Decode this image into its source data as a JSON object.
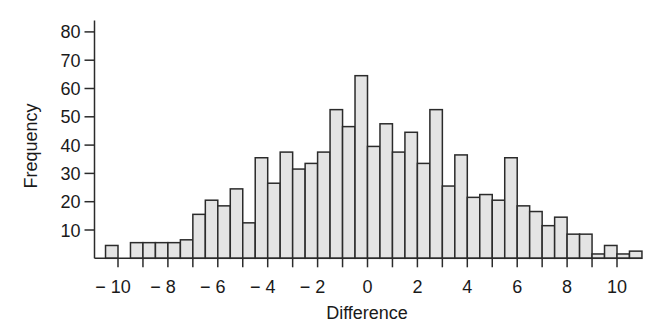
{
  "chart_data": {
    "type": "bar",
    "subtype": "histogram",
    "title": "",
    "xlabel": "Difference",
    "ylabel": "Frequency",
    "bin_width": 0.5,
    "xlim": [
      -10.5,
      11
    ],
    "ylim": [
      0,
      80
    ],
    "grid": false,
    "legend": null,
    "x_ticks": [
      -10,
      -9,
      -8,
      -7,
      -6,
      -5,
      -4,
      -3,
      -2,
      -1,
      0,
      1,
      2,
      3,
      4,
      5,
      6,
      7,
      8,
      9,
      10
    ],
    "x_tick_labels": [
      "−10",
      "",
      "−8",
      "",
      "−6",
      "",
      "−4",
      "",
      "−2",
      "",
      "0",
      "",
      "2",
      "",
      "4",
      "",
      "6",
      "",
      "8",
      "",
      "10"
    ],
    "y_ticks": [
      10,
      20,
      30,
      40,
      50,
      60,
      70,
      80
    ],
    "y_tick_labels": [
      "10",
      "20",
      "30",
      "40",
      "50",
      "60",
      "70",
      "80"
    ],
    "bins": [
      {
        "start": -10.5,
        "end": -10.0,
        "count": 4
      },
      {
        "start": -10.0,
        "end": -9.5,
        "count": 0
      },
      {
        "start": -9.5,
        "end": -9.0,
        "count": 5
      },
      {
        "start": -9.0,
        "end": -8.5,
        "count": 5
      },
      {
        "start": -8.5,
        "end": -8.0,
        "count": 5
      },
      {
        "start": -8.0,
        "end": -7.5,
        "count": 5
      },
      {
        "start": -7.5,
        "end": -7.0,
        "count": 6
      },
      {
        "start": -7.0,
        "end": -6.5,
        "count": 15
      },
      {
        "start": -6.5,
        "end": -6.0,
        "count": 20
      },
      {
        "start": -6.0,
        "end": -5.5,
        "count": 18
      },
      {
        "start": -5.5,
        "end": -5.0,
        "count": 24
      },
      {
        "start": -5.0,
        "end": -4.5,
        "count": 12
      },
      {
        "start": -4.5,
        "end": -4.0,
        "count": 35
      },
      {
        "start": -4.0,
        "end": -3.5,
        "count": 26
      },
      {
        "start": -3.5,
        "end": -3.0,
        "count": 37
      },
      {
        "start": -3.0,
        "end": -2.5,
        "count": 31
      },
      {
        "start": -2.5,
        "end": -2.0,
        "count": 33
      },
      {
        "start": -2.0,
        "end": -1.5,
        "count": 37
      },
      {
        "start": -1.5,
        "end": -1.0,
        "count": 52
      },
      {
        "start": -1.0,
        "end": -0.5,
        "count": 46
      },
      {
        "start": -0.5,
        "end": 0.0,
        "count": 64
      },
      {
        "start": 0.0,
        "end": 0.5,
        "count": 39
      },
      {
        "start": 0.5,
        "end": 1.0,
        "count": 47
      },
      {
        "start": 1.0,
        "end": 1.5,
        "count": 37
      },
      {
        "start": 1.5,
        "end": 2.0,
        "count": 44
      },
      {
        "start": 2.0,
        "end": 2.5,
        "count": 33
      },
      {
        "start": 2.5,
        "end": 3.0,
        "count": 52
      },
      {
        "start": 3.0,
        "end": 3.5,
        "count": 25
      },
      {
        "start": 3.5,
        "end": 4.0,
        "count": 36
      },
      {
        "start": 4.0,
        "end": 4.5,
        "count": 21
      },
      {
        "start": 4.5,
        "end": 5.0,
        "count": 22
      },
      {
        "start": 5.0,
        "end": 5.5,
        "count": 20
      },
      {
        "start": 5.5,
        "end": 6.0,
        "count": 35
      },
      {
        "start": 6.0,
        "end": 6.5,
        "count": 18
      },
      {
        "start": 6.5,
        "end": 7.0,
        "count": 16
      },
      {
        "start": 7.0,
        "end": 7.5,
        "count": 11
      },
      {
        "start": 7.5,
        "end": 8.0,
        "count": 14
      },
      {
        "start": 8.0,
        "end": 8.5,
        "count": 8
      },
      {
        "start": 8.5,
        "end": 9.0,
        "count": 8
      },
      {
        "start": 9.0,
        "end": 9.5,
        "count": 1
      },
      {
        "start": 9.5,
        "end": 10.0,
        "count": 4
      },
      {
        "start": 10.0,
        "end": 10.5,
        "count": 1
      },
      {
        "start": 10.5,
        "end": 11.0,
        "count": 2
      }
    ],
    "categories": [
      "-10.5",
      "-10",
      "-9.5",
      "-9",
      "-8.5",
      "-8",
      "-7.5",
      "-7",
      "-6.5",
      "-6",
      "-5.5",
      "-5",
      "-4.5",
      "-4",
      "-3.5",
      "-3",
      "-2.5",
      "-2",
      "-1.5",
      "-1",
      "-0.5",
      "0",
      "0.5",
      "1",
      "1.5",
      "2",
      "2.5",
      "3",
      "3.5",
      "4",
      "4.5",
      "5",
      "5.5",
      "6",
      "6.5",
      "7",
      "7.5",
      "8",
      "8.5",
      "9",
      "9.5",
      "10",
      "10.5"
    ],
    "values": [
      4,
      0,
      5,
      5,
      5,
      5,
      6,
      15,
      20,
      18,
      24,
      12,
      35,
      26,
      37,
      31,
      33,
      37,
      52,
      46,
      64,
      39,
      47,
      37,
      44,
      33,
      52,
      25,
      36,
      21,
      22,
      20,
      35,
      18,
      16,
      11,
      14,
      8,
      8,
      1,
      4,
      1,
      2
    ],
    "colors": {
      "bar_fill": "#e4e4e4",
      "bar_stroke": "#2b2b2b",
      "axis": "#2b2b2b",
      "text": "#1a1a1a"
    }
  }
}
